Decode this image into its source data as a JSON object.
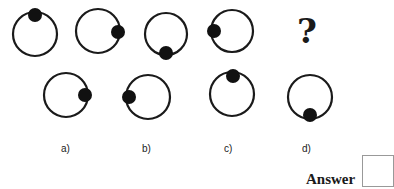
{
  "question": {
    "sequence": [
      {
        "id": "fig-1",
        "dot_position": "top"
      },
      {
        "id": "fig-2",
        "dot_position": "right"
      },
      {
        "id": "fig-3",
        "dot_position": "bottom"
      },
      {
        "id": "fig-4",
        "dot_position": "left"
      }
    ],
    "missing_symbol": "?"
  },
  "options": [
    {
      "label": "a)",
      "dot_position": "right"
    },
    {
      "label": "b)",
      "dot_position": "left"
    },
    {
      "label": "c)",
      "dot_position": "top"
    },
    {
      "label": "d)",
      "dot_position": "bottom"
    }
  ],
  "answer": {
    "label": "Answer",
    "value": ""
  },
  "colors": {
    "stroke": "#1a1a1a",
    "dot": "#111111",
    "background": "#ffffff"
  }
}
